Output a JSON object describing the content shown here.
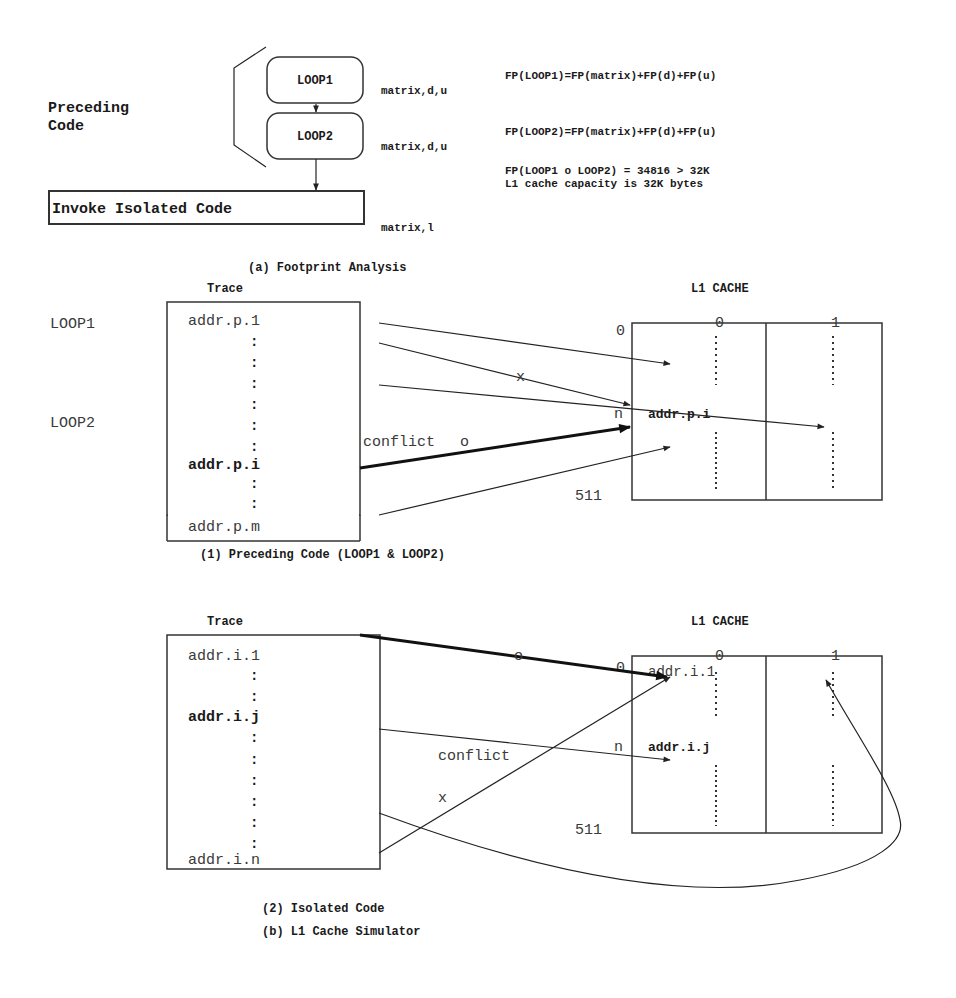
{
  "footprint_analysis": {
    "caption": "(a) Footprint Analysis",
    "preceding_label_line1": "Preceding",
    "preceding_label_line2": "Code",
    "loop1_label": "LOOP1",
    "loop2_label": "LOOP2",
    "invoke_label": "Invoke Isolated Code",
    "loop1_vars": "matrix,d,u",
    "loop2_vars": "matrix,d,u",
    "invoke_vars": "matrix,l",
    "fp_loop1": "FP(LOOP1)=FP(matrix)+FP(d)+FP(u)",
    "fp_loop2": "FP(LOOP2)=FP(matrix)+FP(d)+FP(u)",
    "fp_combined": "FP(LOOP1 o LOOP2) = 34816 > 32K",
    "capacity_note": "L1 cache capacity is 32K bytes"
  },
  "simulator": {
    "caption": "(b) L1 Cache Simulator",
    "preceding": {
      "caption": "(1) Preceding Code (LOOP1 & LOOP2)",
      "trace_title": "Trace",
      "cache_title": "L1 CACHE",
      "side_labels": [
        "LOOP1",
        "LOOP2"
      ],
      "trace_entries": [
        "addr.p.1",
        ":",
        ":",
        ":",
        ":",
        ":",
        ":",
        "addr.p.i",
        ":",
        ":",
        "addr.p.m"
      ],
      "trace_bold_entry": "addr.p.i",
      "cache_col_labels": [
        "0",
        "1"
      ],
      "cache_row_top": "0",
      "cache_row_mid": "n",
      "cache_row_bottom": "511",
      "cache_entry": "addr.p.i",
      "conflict_label": "conflict",
      "hit_marker": "o",
      "miss_marker": "x"
    },
    "isolated": {
      "caption": "(2) Isolated Code",
      "trace_title": "Trace",
      "cache_title": "L1 CACHE",
      "trace_entries": [
        "addr.i.1",
        ":",
        ":",
        "addr.i.j",
        ":",
        ":",
        ":",
        ":",
        ":",
        ":",
        "addr.i.n"
      ],
      "trace_bold_entry": "addr.i.j",
      "cache_col_labels": [
        "0",
        "1"
      ],
      "cache_row_top": "0",
      "cache_row_mid": "n",
      "cache_row_bottom": "511",
      "cache_entry_top": "addr.i.1",
      "cache_entry_mid": "addr.i.j",
      "conflict_label": "conflict",
      "hit_marker": "o",
      "miss_marker": "x"
    }
  }
}
